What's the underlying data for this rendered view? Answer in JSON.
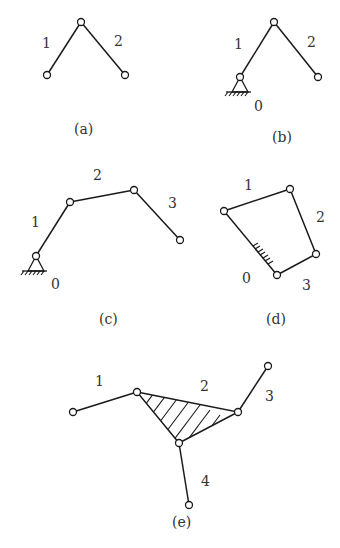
{
  "figure": {
    "a": {
      "caption": "(a)",
      "labels": {
        "link1": "1",
        "link2": "2"
      }
    },
    "b": {
      "caption": "(b)",
      "labels": {
        "link1": "1",
        "link2": "2",
        "ground": "0"
      }
    },
    "c": {
      "caption": "(c)",
      "labels": {
        "link1": "1",
        "link2": "2",
        "link3": "3",
        "ground": "0"
      }
    },
    "d": {
      "caption": "(d)",
      "labels": {
        "link1": "1",
        "link2": "2",
        "link3": "3",
        "ground": "0"
      }
    },
    "e": {
      "caption": "(e)",
      "labels": {
        "link1": "1",
        "link2": "2",
        "link3": "3",
        "link4": "4"
      }
    }
  },
  "colors": {
    "line": "#1a1a1a",
    "text": "#333333",
    "background": "#ffffff"
  }
}
